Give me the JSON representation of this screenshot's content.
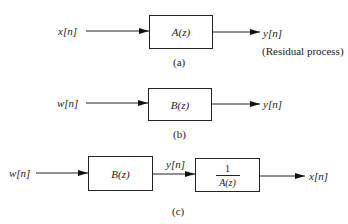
{
  "diagrams": [
    {
      "id": "a",
      "caption": "(a)",
      "input_label": "x[n]",
      "blocks": [
        {
          "label": "A(z)"
        }
      ],
      "output_label": "y[n]",
      "output_note": "(Residual process)"
    },
    {
      "id": "b",
      "caption": "(b)",
      "input_label": "w[n]",
      "blocks": [
        {
          "label": "B(z)"
        }
      ],
      "output_label": "y[n]"
    },
    {
      "id": "c",
      "caption": "(c)",
      "input_label": "w[n]",
      "blocks": [
        {
          "label": "B(z)"
        },
        {
          "numerator": "1",
          "denominator": "A(z)"
        }
      ],
      "intermediate_label": "y[n]",
      "output_label": "x[n]"
    }
  ]
}
